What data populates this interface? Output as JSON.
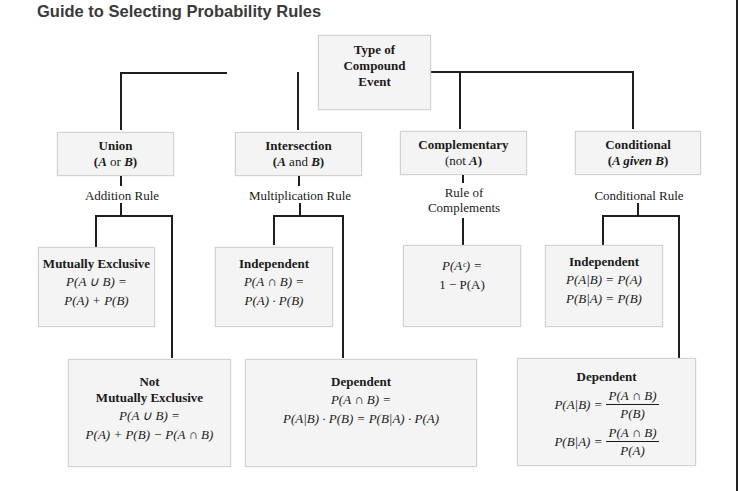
{
  "title": "Guide to Selecting Probability Rules",
  "root": {
    "line1": "Type of",
    "line2": "Compound",
    "line3": "Event"
  },
  "categories": [
    {
      "name": "Union",
      "sub_pre": "(",
      "sub_a": "A",
      "sub_mid": " or ",
      "sub_b": "B",
      "sub_post": ")",
      "rule": "Addition Rule"
    },
    {
      "name": "Intersection",
      "sub_pre": "(",
      "sub_a": "A",
      "sub_mid": " and ",
      "sub_b": "B",
      "sub_post": ")",
      "rule": "Multiplication Rule"
    },
    {
      "name": "Complementary",
      "sub_pre": "(not ",
      "sub_a": "A",
      "sub_post": ")",
      "rule_line1": "Rule of",
      "rule_line2": "Complements"
    },
    {
      "name": "Conditional",
      "sub_pre": "(",
      "sub_a": "A given B",
      "sub_post": ")",
      "rule": "Conditional Rule"
    }
  ],
  "leaves": {
    "mutually_exclusive": {
      "heading": "Mutually Exclusive",
      "f1": "P(A ∪ B) =",
      "f2": "P(A) + P(B)"
    },
    "not_mutually_exclusive": {
      "heading1": "Not",
      "heading2": "Mutually Exclusive",
      "f1": "P(A ∪ B) =",
      "f2": "P(A) + P(B) − P(A ∩ B)"
    },
    "intersection_independent": {
      "heading": "Independent",
      "f1": "P(A ∩ B) =",
      "f2": "P(A) · P(B)"
    },
    "intersection_dependent": {
      "heading": "Dependent",
      "f1": "P(A ∩ B) =",
      "f2": "P(A|B) · P(B) = P(B|A) · P(A)"
    },
    "complement": {
      "f1": "P(Aᶜ) =",
      "f2": "1 − P(A)"
    },
    "conditional_independent": {
      "heading": "Independent",
      "f1": "P(A|B) = P(A)",
      "f2": "P(B|A) = P(B)"
    },
    "conditional_dependent": {
      "heading": "Dependent",
      "f1_lhs": "P(A|B) =",
      "f1_num": "P(A ∩ B)",
      "f1_den": "P(B)",
      "f2_lhs": "P(B|A) =",
      "f2_num": "P(A ∩ B)",
      "f2_den": "P(A)"
    }
  }
}
